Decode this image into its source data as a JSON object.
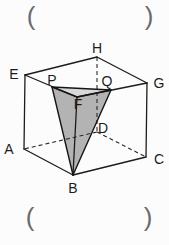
{
  "answer_blanks": {
    "top_left": "(",
    "top_right": ")",
    "bottom_left": "(",
    "bottom_right": ")"
  },
  "figure": {
    "type": "geometry-diagram",
    "vertex_labels": {
      "A": "A",
      "B": "B",
      "C": "C",
      "D": "D",
      "E": "E",
      "F": "F",
      "G": "G",
      "H": "H",
      "P": "P",
      "Q": "Q"
    },
    "colors": {
      "line": "#1c1c1c",
      "shade_side": "#b3b3b3",
      "shade_top": "#d8d8d8",
      "paren": "#6a6a6a",
      "label": "#1c1c1c",
      "background": "#fcfcfc"
    }
  }
}
